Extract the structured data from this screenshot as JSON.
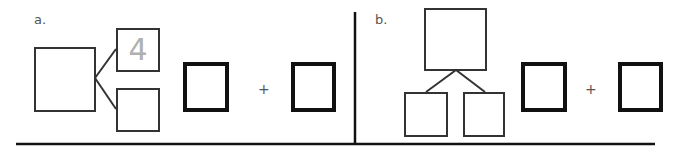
{
  "problems": [
    {
      "label": "a.",
      "orientation": "horizontal",
      "whole_value": "",
      "part_top_value": "4",
      "part_bottom_value": "",
      "equation": {
        "left": "",
        "operator": "+",
        "right": ""
      }
    },
    {
      "label": "b.",
      "orientation": "vertical",
      "whole_value": "",
      "part_left_value": "",
      "part_right_value": "",
      "equation": {
        "left": "",
        "operator": "+",
        "right": ""
      }
    }
  ],
  "colors": {
    "stroke": "#333333",
    "thick_stroke": "#111111",
    "given_number": "#b0b0b0",
    "label": "#555555"
  }
}
